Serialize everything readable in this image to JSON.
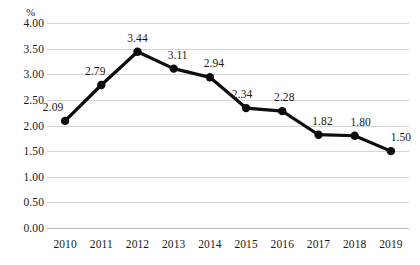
{
  "chart_data": {
    "type": "line",
    "title": "",
    "subtitle": "",
    "xlabel": "",
    "ylabel": "%",
    "unit_label": "%",
    "categories": [
      "2010",
      "2011",
      "2012",
      "2013",
      "2014",
      "2015",
      "2016",
      "2017",
      "2018",
      "2019"
    ],
    "values": [
      2.09,
      2.79,
      3.44,
      3.11,
      2.94,
      2.34,
      2.28,
      1.82,
      1.8,
      1.5
    ],
    "point_labels": [
      "2.09",
      "2.79",
      "3.44",
      "3.11",
      "2.94",
      "2.34",
      "2.28",
      "1.82",
      "1.80",
      "1.50"
    ],
    "ylim": [
      0.0,
      4.0
    ],
    "ytick_step": 0.5,
    "ytick_labels": [
      "4.00",
      "3.50",
      "3.00",
      "2.50",
      "2.00",
      "1.50",
      "1.00",
      "0.50",
      "0.00"
    ],
    "ytick_values": [
      4.0,
      3.5,
      3.0,
      2.5,
      2.0,
      1.5,
      1.0,
      0.5,
      0.0
    ],
    "grid": true,
    "grid_axis": "y",
    "legend": false,
    "legend_position": "none",
    "series": [
      {
        "name": "",
        "values": [
          2.09,
          2.79,
          3.44,
          3.11,
          2.94,
          2.34,
          2.28,
          1.82,
          1.8,
          1.5
        ]
      }
    ],
    "colors": {
      "line": "#0d0d0d",
      "marker": "#0d0d0d",
      "grid": "#d4d4d4",
      "axis": "#b8b8b8",
      "text": "#1a1a1a",
      "background": "#ffffff"
    },
    "style": {
      "line_width": 3.2,
      "marker_radius": 4.2,
      "marker_shape": "circle"
    }
  }
}
